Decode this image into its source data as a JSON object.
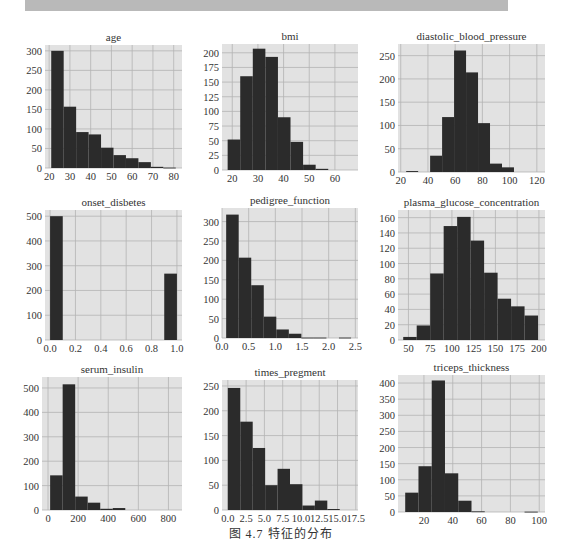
{
  "caption": "图 4.7   特征的分布",
  "colors": {
    "bar": "#2b2b2b",
    "plot_bg": "#e2e2e2",
    "grid": "#b4b4b4",
    "topbar": "#b9b9b9"
  },
  "chart_data": [
    {
      "type": "bar",
      "title": "age",
      "box": [
        45,
        45,
        182,
        168
      ],
      "xlim": [
        18,
        84
      ],
      "ylim": [
        0,
        315
      ],
      "xticks": [
        20,
        30,
        40,
        50,
        60,
        70,
        80
      ],
      "xticklabels": [
        "20",
        "30",
        "40",
        "50",
        "60",
        "70",
        "80"
      ],
      "yticks": [
        0,
        50,
        100,
        150,
        200,
        250,
        300
      ],
      "yticklabels": [
        "0",
        "50",
        "100",
        "150",
        "200",
        "250",
        "300"
      ],
      "bins": [
        21,
        27,
        33,
        39,
        45,
        51,
        57,
        63,
        69,
        75,
        81
      ],
      "values": [
        300,
        157,
        92,
        86,
        52,
        33,
        25,
        15,
        3,
        1
      ]
    },
    {
      "type": "bar",
      "title": "bmi",
      "box": [
        222,
        44,
        358,
        170
      ],
      "xlim": [
        16,
        69
      ],
      "ylim": [
        0,
        215
      ],
      "xticks": [
        20,
        30,
        40,
        50,
        60
      ],
      "xticklabels": [
        "20",
        "30",
        "40",
        "50",
        "60"
      ],
      "yticks": [
        0,
        25,
        50,
        75,
        100,
        125,
        150,
        175,
        200
      ],
      "yticklabels": [
        "0",
        "25",
        "50",
        "75",
        "100",
        "125",
        "150",
        "175",
        "200"
      ],
      "bins": [
        18.2,
        23.1,
        28.0,
        32.9,
        37.8,
        42.7,
        47.6,
        52.5,
        57.4,
        62.3,
        67.1
      ],
      "values": [
        52,
        160,
        207,
        193,
        90,
        48,
        9,
        2,
        0,
        0
      ]
    },
    {
      "type": "bar",
      "title": "diastolic_blood_pressure",
      "box": [
        398,
        44,
        545,
        172
      ],
      "xlim": [
        18,
        126
      ],
      "ylim": [
        0,
        275
      ],
      "xticks": [
        20,
        40,
        60,
        80,
        100,
        120
      ],
      "xticklabels": [
        "20",
        "40",
        "60",
        "80",
        "100",
        "120"
      ],
      "yticks": [
        0,
        50,
        100,
        150,
        200,
        250
      ],
      "yticklabels": [
        "0",
        "50",
        "100",
        "150",
        "200",
        "250"
      ],
      "bins": [
        24,
        32.8,
        41.6,
        50.4,
        59.2,
        68,
        76.8,
        85.6,
        94.4,
        103.2,
        112
      ],
      "values": [
        2,
        0,
        35,
        118,
        261,
        214,
        105,
        18,
        10,
        0
      ]
    },
    {
      "type": "bar",
      "title": "onset_disbetes",
      "box": [
        45,
        210,
        182,
        340
      ],
      "xlim": [
        -0.04,
        1.04
      ],
      "ylim": [
        0,
        525
      ],
      "xticks": [
        0.0,
        0.2,
        0.4,
        0.6,
        0.8,
        1.0
      ],
      "xticklabels": [
        "0.0",
        "0.2",
        "0.4",
        "0.6",
        "0.8",
        "1.0"
      ],
      "yticks": [
        0,
        100,
        200,
        300,
        400,
        500
      ],
      "yticklabels": [
        "0",
        "100",
        "200",
        "300",
        "400",
        "500"
      ],
      "bins": [
        0.0,
        0.1,
        0.2,
        0.3,
        0.4,
        0.5,
        0.6,
        0.7,
        0.8,
        0.9,
        1.0
      ],
      "values": [
        500,
        0,
        0,
        0,
        0,
        0,
        0,
        0,
        0,
        268
      ]
    },
    {
      "type": "bar",
      "title": "pedigree_function",
      "box": [
        222,
        208,
        358,
        338
      ],
      "xlim": [
        0.0,
        2.55
      ],
      "ylim": [
        0,
        335
      ],
      "xticks": [
        0.0,
        0.5,
        1.0,
        1.5,
        2.0,
        2.5
      ],
      "xticklabels": [
        "0.0",
        "0.5",
        "1.0",
        "1.5",
        "2.0",
        "2.5"
      ],
      "yticks": [
        0,
        50,
        100,
        150,
        200,
        250,
        300
      ],
      "yticklabels": [
        "0",
        "50",
        "100",
        "150",
        "200",
        "250",
        "300"
      ],
      "bins": [
        0.078,
        0.313,
        0.548,
        0.783,
        1.018,
        1.253,
        1.488,
        1.723,
        1.958,
        2.193,
        2.42
      ],
      "values": [
        318,
        207,
        136,
        55,
        22,
        11,
        1,
        1,
        0,
        1
      ]
    },
    {
      "type": "bar",
      "title": "plasma_glucose_concentration",
      "box": [
        398,
        210,
        545,
        340
      ],
      "xlim": [
        38,
        207
      ],
      "ylim": [
        0,
        170
      ],
      "xticks": [
        50,
        75,
        100,
        125,
        150,
        175,
        200
      ],
      "xticklabels": [
        "50",
        "75",
        "100",
        "125",
        "150",
        "175",
        "200"
      ],
      "yticks": [
        0,
        20,
        40,
        60,
        80,
        100,
        120,
        140,
        160
      ],
      "yticklabels": [
        "0",
        "20",
        "40",
        "60",
        "80",
        "100",
        "120",
        "140",
        "160"
      ],
      "bins": [
        44,
        59.5,
        75,
        90.5,
        106,
        121.5,
        137,
        152.5,
        168,
        183.5,
        199
      ],
      "values": [
        4,
        19,
        87,
        149,
        161,
        130,
        88,
        54,
        44,
        32
      ]
    },
    {
      "type": "bar",
      "title": "serum_insulin",
      "box": [
        42,
        377,
        182,
        510
      ],
      "xlim": [
        -40,
        890
      ],
      "ylim": [
        0,
        545
      ],
      "xticks": [
        0,
        200,
        400,
        600,
        800
      ],
      "xticklabels": [
        "0",
        "200",
        "400",
        "600",
        "800"
      ],
      "yticks": [
        0,
        100,
        200,
        300,
        400,
        500
      ],
      "yticklabels": [
        "0",
        "100",
        "200",
        "300",
        "400",
        "500"
      ],
      "bins": [
        14,
        97.2,
        180.4,
        263.6,
        346.8,
        430,
        513.2,
        596.4,
        679.6,
        762.8,
        846
      ],
      "values": [
        142,
        515,
        55,
        30,
        5,
        8,
        0,
        0,
        0,
        0
      ]
    },
    {
      "type": "bar",
      "title": "times_pregment",
      "box": [
        222,
        380,
        358,
        510
      ],
      "xlim": [
        -0.8,
        17.8
      ],
      "ylim": [
        0,
        262
      ],
      "xticks": [
        0.0,
        2.5,
        5.0,
        7.5,
        10.0,
        12.5,
        15.0,
        17.5
      ],
      "xticklabels": [
        "0.0",
        "2.5",
        "5.0",
        "7.5",
        "10.0",
        "12.5",
        "15.0",
        "17.5"
      ],
      "yticks": [
        0,
        50,
        100,
        150,
        200,
        250
      ],
      "yticklabels": [
        "0",
        "50",
        "100",
        "150",
        "200",
        "250"
      ],
      "bins": [
        0,
        1.7,
        3.4,
        5.1,
        6.8,
        8.5,
        10.2,
        11.9,
        13.6,
        15.3,
        17
      ],
      "values": [
        246,
        178,
        125,
        50,
        83,
        52,
        9,
        19,
        2,
        0
      ]
    },
    {
      "type": "bar",
      "title": "triceps_thickness",
      "box": [
        398,
        375,
        545,
        512
      ],
      "xlim": [
        2,
        104
      ],
      "ylim": [
        0,
        425
      ],
      "xticks": [
        20,
        40,
        60,
        80,
        100
      ],
      "xticklabels": [
        "20",
        "40",
        "60",
        "80",
        "100"
      ],
      "yticks": [
        0,
        50,
        100,
        150,
        200,
        250,
        300,
        350,
        400
      ],
      "yticklabels": [
        "0",
        "50",
        "100",
        "150",
        "200",
        "250",
        "300",
        "350",
        "400"
      ],
      "bins": [
        7,
        16.2,
        25.4,
        34.6,
        43.8,
        53,
        62.2,
        71.4,
        80.6,
        89.8,
        99
      ],
      "values": [
        60,
        142,
        408,
        120,
        35,
        2,
        0,
        0,
        0,
        1
      ]
    }
  ]
}
